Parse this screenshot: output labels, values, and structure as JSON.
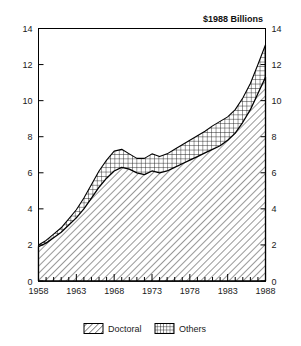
{
  "chart_data": {
    "type": "area",
    "stacked": true,
    "title": "",
    "unit_label": "$1988 Billions",
    "xlabel": "",
    "ylabel": "",
    "xlim": [
      1958,
      1988
    ],
    "ylim": [
      0,
      14
    ],
    "grid": false,
    "legend_position": "bottom",
    "y_ticks": [
      0,
      2,
      4,
      6,
      8,
      10,
      12,
      14
    ],
    "y_tick_labels": [
      "0",
      "2",
      "4",
      "6",
      "8",
      "10",
      "12",
      "14"
    ],
    "y_axis_both_sides": true,
    "x_ticks": [
      1958,
      1963,
      1968,
      1973,
      1978,
      1983,
      1988
    ],
    "x_tick_labels": [
      "1958",
      "1963",
      "1968",
      "1973",
      "1978",
      "1983",
      "1988"
    ],
    "x_minor_tick_interval": 1,
    "x": [
      1958,
      1959,
      1960,
      1961,
      1962,
      1963,
      1964,
      1965,
      1966,
      1967,
      1968,
      1969,
      1970,
      1971,
      1972,
      1973,
      1974,
      1975,
      1976,
      1977,
      1978,
      1979,
      1980,
      1981,
      1982,
      1983,
      1984,
      1985,
      1986,
      1987,
      1988
    ],
    "series": [
      {
        "name": "Doctoral",
        "pattern": "diagonal-hatch",
        "values": [
          1.9,
          2.1,
          2.4,
          2.7,
          3.1,
          3.5,
          4.0,
          4.6,
          5.2,
          5.7,
          6.1,
          6.3,
          6.2,
          6.0,
          5.9,
          6.1,
          6.0,
          6.1,
          6.3,
          6.5,
          6.7,
          6.9,
          7.1,
          7.3,
          7.5,
          7.8,
          8.2,
          8.8,
          9.5,
          10.4,
          11.3
        ]
      },
      {
        "name": "Others",
        "pattern": "cross-hatch",
        "values": [
          0.1,
          0.15,
          0.2,
          0.25,
          0.35,
          0.45,
          0.6,
          0.75,
          0.9,
          1.0,
          1.1,
          1.0,
          0.85,
          0.8,
          0.9,
          0.95,
          0.9,
          0.95,
          1.0,
          1.05,
          1.1,
          1.15,
          1.2,
          1.3,
          1.35,
          1.3,
          1.3,
          1.35,
          1.45,
          1.6,
          1.8
        ]
      }
    ],
    "totals": [
      2.0,
      2.25,
      2.6,
      2.95,
      3.45,
      3.95,
      4.6,
      5.35,
      6.1,
      6.7,
      7.2,
      7.3,
      7.05,
      6.8,
      6.8,
      7.05,
      6.9,
      7.05,
      7.3,
      7.55,
      7.8,
      8.05,
      8.3,
      8.6,
      8.85,
      9.1,
      9.5,
      10.15,
      10.95,
      12.0,
      13.1
    ]
  },
  "legend": {
    "items": [
      {
        "label": "Doctoral",
        "swatch": "diagonal-hatch-swatch"
      },
      {
        "label": "Others",
        "swatch": "cross-hatch-swatch"
      }
    ]
  },
  "colors": {
    "ink": "#000000",
    "background": "#ffffff",
    "pattern_stroke": "#1a1a1a"
  }
}
